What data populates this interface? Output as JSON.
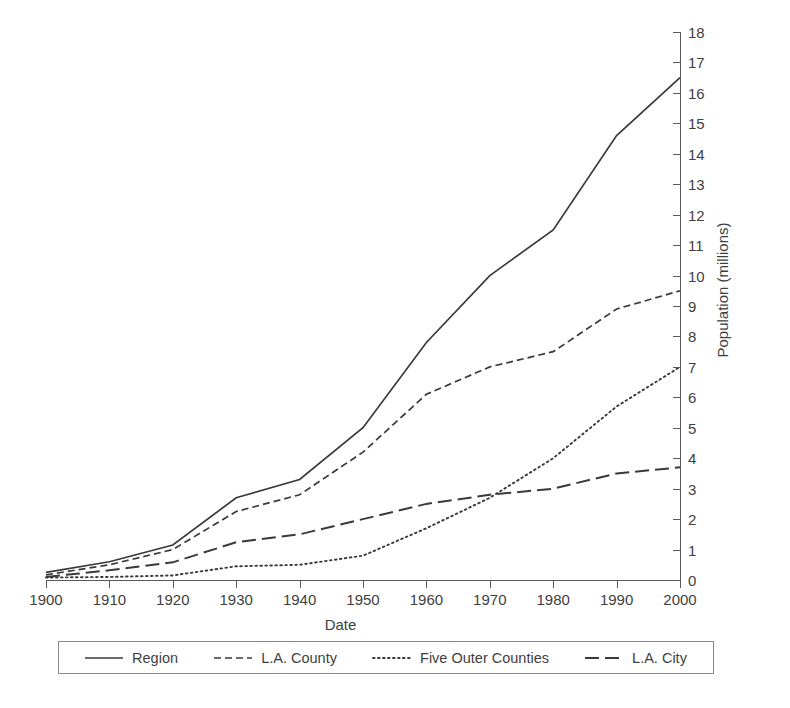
{
  "chart_data": {
    "type": "line",
    "title": "",
    "xlabel": "Date",
    "ylabel": "Population (millions)",
    "xlim": [
      1900,
      2000
    ],
    "ylim": [
      0,
      18
    ],
    "grid": false,
    "legend_position": "bottom",
    "x": [
      1900,
      1910,
      1920,
      1930,
      1940,
      1950,
      1960,
      1970,
      1980,
      1990,
      2000
    ],
    "xticks": [
      "1900",
      "1910",
      "1920",
      "1930",
      "1940",
      "1950",
      "1960",
      "1970",
      "1980",
      "1990",
      "2000"
    ],
    "yticks": [
      "0",
      "1",
      "2",
      "3",
      "4",
      "5",
      "6",
      "7",
      "8",
      "9",
      "10",
      "11",
      "12",
      "13",
      "14",
      "15",
      "16",
      "17",
      "18"
    ],
    "series": [
      {
        "name": "Region",
        "style": "solid",
        "values": [
          0.25,
          0.6,
          1.15,
          2.7,
          3.3,
          5.0,
          7.8,
          10.0,
          11.5,
          14.6,
          16.5
        ]
      },
      {
        "name": "L.A. County",
        "style": "dashed",
        "values": [
          0.17,
          0.5,
          1.0,
          2.25,
          2.8,
          4.2,
          6.1,
          7.0,
          7.5,
          8.9,
          9.5
        ]
      },
      {
        "name": "Five Outer Counties",
        "style": "dotted",
        "values": [
          0.08,
          0.1,
          0.15,
          0.45,
          0.5,
          0.8,
          1.7,
          2.7,
          4.0,
          5.7,
          7.0
        ]
      },
      {
        "name": "L.A. City",
        "style": "long-dashed",
        "values": [
          0.1,
          0.32,
          0.58,
          1.24,
          1.5,
          2.0,
          2.5,
          2.8,
          3.0,
          3.5,
          3.7
        ]
      }
    ]
  },
  "legend": {
    "items": [
      {
        "label": "Region",
        "style": "solid"
      },
      {
        "label": "L.A. County",
        "style": "dashed"
      },
      {
        "label": "Five Outer Counties",
        "style": "dotted"
      },
      {
        "label": "L.A. City",
        "style": "long-dashed"
      }
    ]
  }
}
